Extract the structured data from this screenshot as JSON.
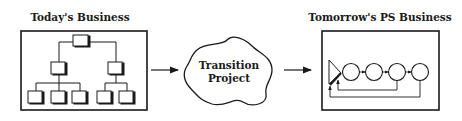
{
  "diagram": {
    "left": {
      "title": "Today's Business",
      "shape": "hierarchical-org-chart"
    },
    "middle": {
      "line1": "Transition",
      "line2": "Project",
      "shape": "cloud"
    },
    "right": {
      "title": "Tomorrow's PS Business",
      "shape": "process-flow-with-feedback"
    },
    "colors": {
      "stroke": "#1a1a1a",
      "background": "#ffffff"
    }
  }
}
